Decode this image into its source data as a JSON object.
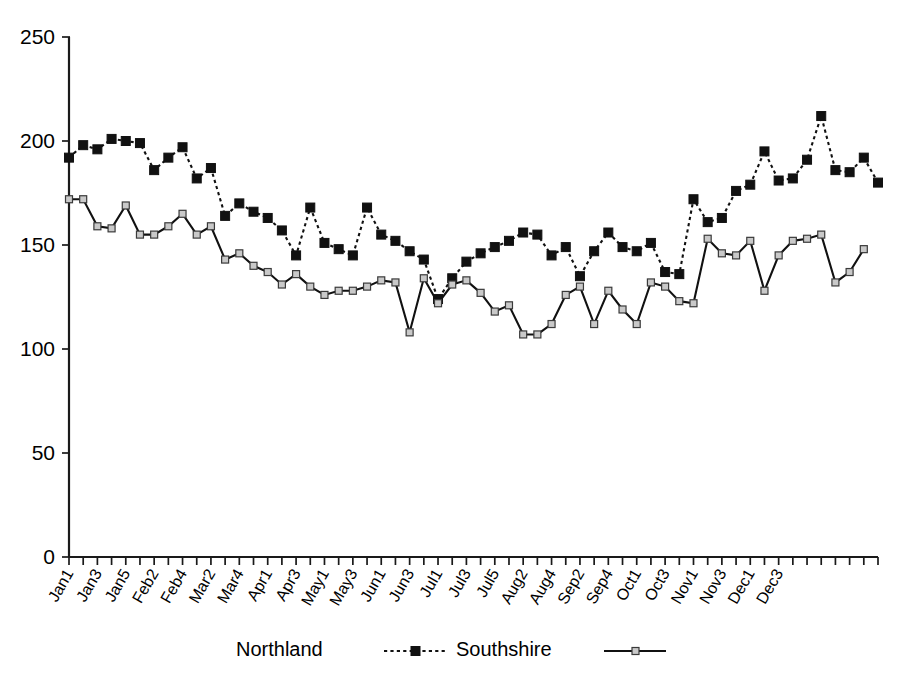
{
  "chart_data": {
    "type": "line",
    "title": "",
    "subtitle": "",
    "xlabel": "",
    "ylabel": "",
    "ylim": [
      0,
      250
    ],
    "yticks": [
      0,
      50,
      100,
      150,
      200,
      250
    ],
    "grid": false,
    "legend_position": "bottom",
    "x_tick_labels_every": 2,
    "categories": [
      "Jan1",
      "Jan2",
      "Jan3",
      "Jan4",
      "Jan5",
      "Feb1",
      "Feb2",
      "Feb3",
      "Feb4",
      "Mar1",
      "Mar2",
      "Mar3",
      "Mar4",
      "Mar5",
      "Apr1",
      "Apr2",
      "Apr3",
      "Apr4",
      "May1",
      "May2",
      "May3",
      "May4",
      "Jun1",
      "Jun2",
      "Jun3",
      "Jun4",
      "Jul1",
      "Jul2",
      "Jul3",
      "Jul4",
      "Jul5",
      "Aug1",
      "Aug2",
      "Aug3",
      "Aug4",
      "Sep1",
      "Sep2",
      "Sep3",
      "Sep4",
      "Sep5",
      "Oct1",
      "Oct2",
      "Oct3",
      "Oct4",
      "Nov1",
      "Nov2",
      "Nov3",
      "Nov4",
      "Dec1",
      "Dec2",
      "Dec3",
      "Dec4"
    ],
    "visible_x_tick_labels": [
      "Jan1",
      "Jan3",
      "Jan5",
      "Feb2",
      "Feb4",
      "Mar2",
      "Mar4",
      "Apr1",
      "Apr3",
      "May1",
      "May3",
      "Jun1",
      "Jun3",
      "Jul1",
      "Jul3",
      "Jul5",
      "Aug2",
      "Aug4",
      "Sep2",
      "Sep4",
      "Oct1",
      "Oct3",
      "Nov1",
      "Nov3",
      "Dec1",
      "Dec3"
    ],
    "series": [
      {
        "name": "Northland",
        "marker": "filled-square",
        "line_style": "dotted",
        "color": "#111111",
        "values": [
          192,
          198,
          196,
          201,
          200,
          199,
          186,
          192,
          197,
          182,
          187,
          164,
          170,
          166,
          163,
          157,
          145,
          168,
          151,
          148,
          145,
          168,
          155,
          152,
          147,
          143,
          124,
          134,
          142,
          146,
          149,
          152,
          156,
          155,
          145,
          149,
          135,
          147,
          156,
          149,
          147,
          151,
          137,
          136,
          172,
          161,
          163,
          176,
          179,
          195,
          181,
          182
        ]
      },
      {
        "name": "Southshire",
        "marker": "open-square",
        "line_style": "solid",
        "color": "#111111",
        "values": [
          172,
          172,
          159,
          158,
          169,
          155,
          155,
          159,
          165,
          155,
          159,
          143,
          146,
          140,
          137,
          131,
          136,
          130,
          126,
          128,
          128,
          130,
          133,
          132,
          108,
          134,
          122,
          131,
          133,
          127,
          118,
          121,
          107,
          107,
          112,
          126,
          130,
          112,
          128,
          119,
          112,
          132,
          130,
          123,
          122,
          153,
          146,
          145,
          152,
          128,
          145,
          152
        ]
      }
    ],
    "series_tail": [
      {
        "name": "Northland",
        "extra_values": [
          191,
          212,
          186,
          185,
          192,
          180
        ]
      },
      {
        "name": "Southshire",
        "extra_values": [
          153,
          155,
          132,
          137,
          148
        ]
      }
    ]
  },
  "axes": {
    "y_tick_labels": [
      "250",
      "200",
      "150",
      "100",
      "50",
      "0"
    ]
  },
  "legend": {
    "entries": [
      {
        "label": "Northland",
        "style": "dotted-filled-square"
      },
      {
        "label": "Southshire",
        "style": "solid-open-square"
      }
    ]
  }
}
